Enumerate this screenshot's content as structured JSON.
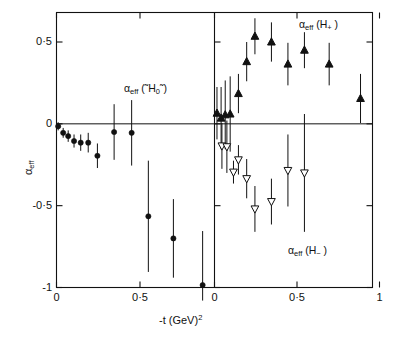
{
  "figure": {
    "axis_y_label_alpha": "α",
    "axis_y_label_sub": "eff",
    "axis_x_label_main": "-t  (GeV)",
    "axis_x_label_sup": "2"
  },
  "labels": {
    "left_panel": {
      "alpha": "α",
      "sub": "eff",
      "open": " (˜H",
      "zero": "0",
      "close": "˜)"
    },
    "right_top": {
      "alpha": "α",
      "sub": "eff",
      "open": " (H",
      "sign": "+",
      "close": " )"
    },
    "right_bottom": {
      "alpha": "α",
      "sub": "eff",
      "open": " (H",
      "sign": "−",
      "close": " )"
    }
  },
  "ticks": {
    "y": [
      {
        "label": "0·5",
        "value": 0.5
      },
      {
        "label": "0",
        "value": 0
      },
      {
        "label": "-0·5",
        "value": -0.5
      },
      {
        "label": "-1",
        "value": -1
      }
    ],
    "x_left": [
      {
        "label": "0",
        "value": 0
      },
      {
        "label": "0·5",
        "value": 0.5
      }
    ],
    "x_right": [
      {
        "label": "0",
        "value": 0
      },
      {
        "label": "0·5",
        "value": 0.5
      },
      {
        "label": "1",
        "value": 1
      }
    ]
  },
  "colors": {
    "ink": "#111111",
    "frame": "#111111",
    "marker_filled": "#111111",
    "marker_open_fill": "#ffffff"
  },
  "chart_data": {
    "type": "scatter",
    "title": "",
    "xlabel": "-t (GeV)^2",
    "ylabel": "alpha_eff",
    "ylim": [
      -1.08,
      0.78
    ],
    "grid": false,
    "legend": "inline-annotations",
    "panels": [
      {
        "name": "left",
        "annotation": "α_eff (˜H₀˜)",
        "xlim": [
          0,
          0.96
        ],
        "xticks": [
          0,
          0.5
        ],
        "series": [
          {
            "name": "alpha_eff(H0tilde)",
            "marker": "filled-circle",
            "points": [
              {
                "x": 0.01,
                "y": -0.015,
                "yerr": 0.025
              },
              {
                "x": 0.04,
                "y": -0.055,
                "yerr": 0.03
              },
              {
                "x": 0.07,
                "y": -0.075,
                "yerr": 0.035
              },
              {
                "x": 0.105,
                "y": -0.105,
                "yerr": 0.04
              },
              {
                "x": 0.145,
                "y": -0.115,
                "yerr": 0.05
              },
              {
                "x": 0.19,
                "y": -0.115,
                "yerr": 0.06
              },
              {
                "x": 0.245,
                "y": -0.195,
                "yerr": 0.075
              },
              {
                "x": 0.345,
                "y": -0.05,
                "yerr": 0.17
              },
              {
                "x": 0.45,
                "y": -0.055,
                "yerr": 0.2
              },
              {
                "x": 0.55,
                "y": -0.565,
                "yerr": 0.34
              },
              {
                "x": 0.7,
                "y": -0.7,
                "yerr": 0.24
              },
              {
                "x": 0.875,
                "y": -0.985,
                "yerr": 0.33
              }
            ]
          }
        ]
      },
      {
        "name": "right",
        "annotations": [
          "α_eff (H₊)",
          "α_eff (H₋)"
        ],
        "xlim": [
          0,
          1.0
        ],
        "xticks": [
          0,
          0.5,
          1
        ],
        "series": [
          {
            "name": "alpha_eff(H+)",
            "marker": "filled-triangle-up",
            "points": [
              {
                "x": 0.015,
                "y": 0.065,
                "yerr": 0.16
              },
              {
                "x": 0.04,
                "y": 0.035,
                "yerr": 0.19
              },
              {
                "x": 0.065,
                "y": 0.055,
                "yerr": 0.21
              },
              {
                "x": 0.095,
                "y": 0.06,
                "yerr": 0.23
              },
              {
                "x": 0.145,
                "y": 0.185,
                "yerr": 0.12
              },
              {
                "x": 0.195,
                "y": 0.38,
                "yerr": 0.12
              },
              {
                "x": 0.245,
                "y": 0.535,
                "yerr": 0.11
              },
              {
                "x": 0.345,
                "y": 0.5,
                "yerr": 0.12
              },
              {
                "x": 0.445,
                "y": 0.365,
                "yerr": 0.13
              },
              {
                "x": 0.545,
                "y": 0.45,
                "yerr": 0.11
              },
              {
                "x": 0.695,
                "y": 0.365,
                "yerr": 0.13
              },
              {
                "x": 0.885,
                "y": 0.155,
                "yerr": 0.15
              }
            ]
          },
          {
            "name": "alpha_eff(H-)",
            "marker": "open-triangle-down",
            "points": [
              {
                "x": 0.045,
                "y": -0.135,
                "yerr": 0.14
              },
              {
                "x": 0.075,
                "y": -0.14,
                "yerr": 0.16
              },
              {
                "x": 0.115,
                "y": -0.295,
                "yerr": 0.07
              },
              {
                "x": 0.145,
                "y": -0.22,
                "yerr": 0.09
              },
              {
                "x": 0.195,
                "y": -0.335,
                "yerr": 0.12
              },
              {
                "x": 0.245,
                "y": -0.52,
                "yerr": 0.14
              },
              {
                "x": 0.345,
                "y": -0.475,
                "yerr": 0.14
              },
              {
                "x": 0.445,
                "y": -0.285,
                "yerr": 0.22
              },
              {
                "x": 0.545,
                "y": -0.3,
                "yerr": 0.36
              }
            ]
          }
        ]
      }
    ]
  }
}
